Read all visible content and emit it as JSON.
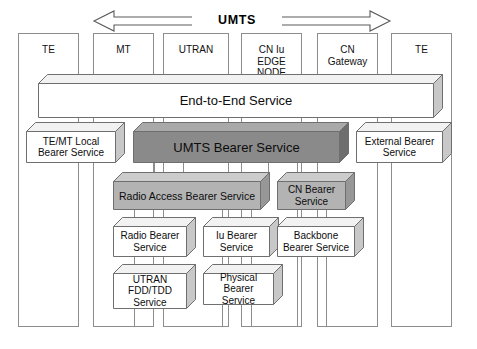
{
  "diagram": {
    "span_arrow": {
      "label": "UMTS",
      "direction": "double",
      "name": "umts-span-arrow"
    },
    "columns": [
      {
        "id": "te-left",
        "label": "TE",
        "x": 18,
        "y": 33,
        "w": 61,
        "h": 294
      },
      {
        "id": "mt",
        "label": "MT",
        "x": 93,
        "y": 33,
        "w": 61,
        "h": 294
      },
      {
        "id": "utran",
        "label": "UTRAN",
        "x": 163,
        "y": 33,
        "w": 66,
        "h": 294
      },
      {
        "id": "cn-iu-edge",
        "label": "CN Iu\nEDGE\nNODE",
        "x": 241,
        "y": 33,
        "w": 61,
        "h": 294
      },
      {
        "id": "cn-gateway",
        "label": "CN\nGateway",
        "x": 317,
        "y": 33,
        "w": 61,
        "h": 294
      },
      {
        "id": "te-right",
        "label": "TE",
        "x": 391,
        "y": 33,
        "w": 61,
        "h": 294
      }
    ],
    "boxes": [
      {
        "id": "end-to-end-service",
        "label": "End-to-End Service",
        "x": 38,
        "y": 74,
        "w": 405,
        "h": 44,
        "fill": "#ffffff",
        "top": "#f2f2f2",
        "side": "#c8c8c8",
        "size": "big"
      },
      {
        "id": "te-mt-local-bearer-service",
        "label": "TE/MT Local\nBearer Service",
        "x": 26,
        "y": 122,
        "w": 99,
        "h": 41,
        "fill": "#ffffff",
        "top": "#f2f2f2",
        "side": "#c8c8c8",
        "size": "small"
      },
      {
        "id": "umts-bearer-service",
        "label": "UMTS Bearer Service",
        "x": 133,
        "y": 122,
        "w": 216,
        "h": 41,
        "fill": "#8a8a8a",
        "top": "#a9a9a9",
        "side": "#6e6e6e",
        "size": "big"
      },
      {
        "id": "external-bearer-service",
        "label": "External Bearer\nService",
        "x": 356,
        "y": 122,
        "w": 96,
        "h": 41,
        "fill": "#ffffff",
        "top": "#f2f2f2",
        "side": "#c8c8c8",
        "size": "small"
      },
      {
        "id": "radio-access-bearer-service",
        "label": "Radio Access Bearer Service",
        "x": 113,
        "y": 172,
        "w": 157,
        "h": 38,
        "fill": "#b3b3b3",
        "top": "#cccccc",
        "side": "#979797",
        "size": "mid"
      },
      {
        "id": "cn-bearer-service",
        "label": "CN Bearer\nService",
        "x": 277,
        "y": 172,
        "w": 78,
        "h": 38,
        "fill": "#b3b3b3",
        "top": "#cccccc",
        "side": "#979797",
        "size": "small"
      },
      {
        "id": "radio-bearer-service",
        "label": "Radio Bearer\nService",
        "x": 113,
        "y": 217,
        "w": 83,
        "h": 40,
        "fill": "#ffffff",
        "top": "#f2f2f2",
        "side": "#c8c8c8",
        "size": "small"
      },
      {
        "id": "iu-bearer-service",
        "label": "Iu Bearer\nService",
        "x": 203,
        "y": 217,
        "w": 76,
        "h": 40,
        "fill": "#ffffff",
        "top": "#f2f2f2",
        "side": "#c8c8c8",
        "size": "small"
      },
      {
        "id": "backbone-bearer-service",
        "label": "Backbone\nBearer Service",
        "x": 277,
        "y": 217,
        "w": 87,
        "h": 40,
        "fill": "#ffffff",
        "top": "#f2f2f2",
        "side": "#c8c8c8",
        "size": "small"
      },
      {
        "id": "utran-fdd-tdd-service",
        "label": "UTRAN\nFDD/TDD\nService",
        "x": 113,
        "y": 264,
        "w": 83,
        "h": 45,
        "fill": "#ffffff",
        "top": "#f2f2f2",
        "side": "#c8c8c8",
        "size": "small"
      },
      {
        "id": "physical-bearer-service",
        "label": "Physical\nBearer Service",
        "x": 203,
        "y": 264,
        "w": 80,
        "h": 41,
        "fill": "#ffffff",
        "top": "#f2f2f2",
        "side": "#c8c8c8",
        "size": "small"
      }
    ]
  }
}
